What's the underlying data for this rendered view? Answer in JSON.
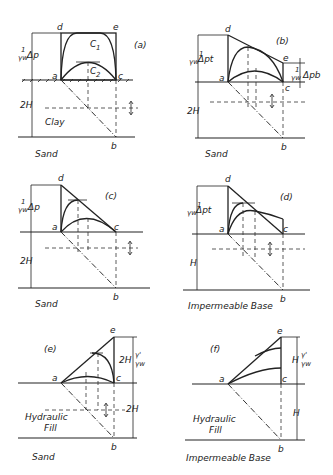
{
  "panels": [
    {
      "id": "a",
      "label": "(a)",
      "points": {
        "a": "a",
        "b": "b",
        "c": "c",
        "d": "d",
        "e": "e"
      },
      "curves": [
        "C1",
        "C2"
      ],
      "left_dim": "Δp",
      "depth_dim": "2H",
      "layer": "Clay",
      "base": "Sand"
    },
    {
      "id": "b",
      "label": "(b)",
      "points": {
        "a": "a",
        "b": "b",
        "c": "c",
        "d": "d",
        "e": "e"
      },
      "left_dim": "Δpt",
      "right_dim": "Δpb",
      "depth_dim": "2H",
      "base": "Sand"
    },
    {
      "id": "c",
      "label": "(c)",
      "points": {
        "a": "a",
        "b": "b",
        "c": "c",
        "d": "d"
      },
      "left_dim": "Δp",
      "depth_dim": "2H",
      "base": "Sand"
    },
    {
      "id": "d",
      "label": "(d)",
      "points": {
        "a": "a",
        "b": "b",
        "c": "c",
        "d": "d"
      },
      "left_dim": "Δpt",
      "depth_dim": "H",
      "base": "Impermeable Base"
    },
    {
      "id": "e",
      "label": "(e)",
      "points": {
        "a": "a",
        "b": "b",
        "c": "c",
        "e": "e"
      },
      "right_top_dim": "2H γ'/γw",
      "right_dim": "2H",
      "layer": "Hydraulic Fill",
      "base": "Sand"
    },
    {
      "id": "f",
      "label": "(f)",
      "points": {
        "a": "a",
        "b": "b",
        "c": "c",
        "e": "e"
      },
      "right_top_dim": "H γ'/γw",
      "right_dim": "H",
      "layer": "Hydraulic Fill",
      "base": "Impermeable Base"
    }
  ],
  "text": {
    "a_label": "(a)",
    "b_label": "(b)",
    "c_label": "(c)",
    "d_label": "(d)",
    "e_label": "(e)",
    "f_label": "(f)",
    "pt_a": "a",
    "pt_b": "b",
    "pt_c": "c",
    "pt_d": "d",
    "pt_e": "e",
    "C1": "C",
    "C1sub": "1",
    "C2": "C",
    "C2sub": "2",
    "frac_num": "1",
    "frac_den": "γw",
    "dp": "Δp",
    "dpt": "Δpt",
    "dpb": "Δpb",
    "twoH": "2H",
    "H": "H",
    "clay": "Clay",
    "sand": "Sand",
    "imp": "Impermeable Base",
    "hyd1": "Hydraulic",
    "hyd2": "Fill",
    "twoHg": "2H",
    "Hg": "H",
    "gp": "γ'",
    "gw": "γw"
  }
}
